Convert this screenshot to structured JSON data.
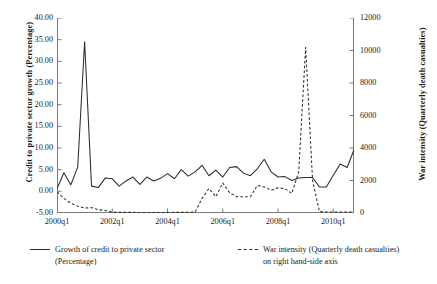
{
  "axes": {
    "left": {
      "title": "Credit to private sector growth (Percentage)",
      "ticks": [
        "40.00",
        "35.00",
        "30.00",
        "25.00",
        "20.00",
        "15.00",
        "10.00",
        "5.00",
        "0.00",
        "-5.00"
      ],
      "min": -5,
      "max": 40,
      "step": 5
    },
    "right": {
      "title": "War intensity (Quarterly death casualties)",
      "ticks": [
        "12000",
        "10000",
        "8000",
        "6000",
        "4000",
        "2000",
        "0"
      ],
      "min": 0,
      "max": 12000,
      "step": 2000
    },
    "bottom": {
      "ticks": [
        "2000q1",
        "2002q1",
        "2004q1",
        "2006q1",
        "2008q1",
        "2010q1"
      ]
    }
  },
  "legend": {
    "entries": [
      {
        "style": "solid",
        "line1": "Growth of credit to private sector",
        "line2": "(Percentage)"
      },
      {
        "style": "dashed",
        "line1": "War intensity (Quarterly death casualties)",
        "line2": "on right hand-side axis"
      }
    ]
  },
  "chart_data": {
    "type": "line",
    "title": "",
    "xlabel": "",
    "ylabel": "Credit to private sector growth (Percentage)",
    "y2label": "War intensity (Quarterly death casualties)",
    "ylim": [
      -5,
      40
    ],
    "y2lim": [
      0,
      12000
    ],
    "grid": false,
    "legend_position": "below",
    "x": [
      "2000q1",
      "2000q2",
      "2000q3",
      "2000q4",
      "2001q1",
      "2001q2",
      "2001q3",
      "2001q4",
      "2002q1",
      "2002q2",
      "2002q3",
      "2002q4",
      "2003q1",
      "2003q2",
      "2003q3",
      "2003q4",
      "2004q1",
      "2004q2",
      "2004q3",
      "2004q4",
      "2005q1",
      "2005q2",
      "2005q3",
      "2005q4",
      "2006q1",
      "2006q2",
      "2006q3",
      "2006q4",
      "2007q1",
      "2007q2",
      "2007q3",
      "2007q4",
      "2008q1",
      "2008q2",
      "2008q3",
      "2008q4",
      "2009q1",
      "2009q2",
      "2009q3",
      "2009q4",
      "2010q1",
      "2010q2",
      "2010q3",
      "2010q4"
    ],
    "series": [
      {
        "name": "Growth of credit to private sector (Percentage)",
        "axis": "left",
        "style": "solid",
        "color": "#2b2b2b",
        "values": [
          0.6,
          4.3,
          1.5,
          5.6,
          34.5,
          1.2,
          0.9,
          3.1,
          2.9,
          1.2,
          2.4,
          3.3,
          1.6,
          3.3,
          2.4,
          3.0,
          4.1,
          2.9,
          5.0,
          3.5,
          4.5,
          6.0,
          3.6,
          4.9,
          3.3,
          5.5,
          5.7,
          4.2,
          3.6,
          5.2,
          7.4,
          4.5,
          3.3,
          3.4,
          2.5,
          3.1,
          3.2,
          3.2,
          1.0,
          1.0,
          3.7,
          6.3,
          5.5,
          9.6
        ]
      },
      {
        "name": "War intensity (Quarterly death casualties)",
        "axis": "right",
        "style": "dashed",
        "color": "#2b2b2b",
        "values": [
          1300,
          900,
          600,
          420,
          300,
          330,
          200,
          160,
          60,
          40,
          40,
          40,
          30,
          30,
          30,
          30,
          30,
          40,
          40,
          40,
          60,
          900,
          1500,
          1000,
          1850,
          1250,
          1000,
          1000,
          1000,
          1700,
          1600,
          1400,
          1550,
          1500,
          1200,
          2550,
          10200,
          2000,
          90,
          60,
          60,
          60,
          60,
          60
        ]
      }
    ]
  }
}
